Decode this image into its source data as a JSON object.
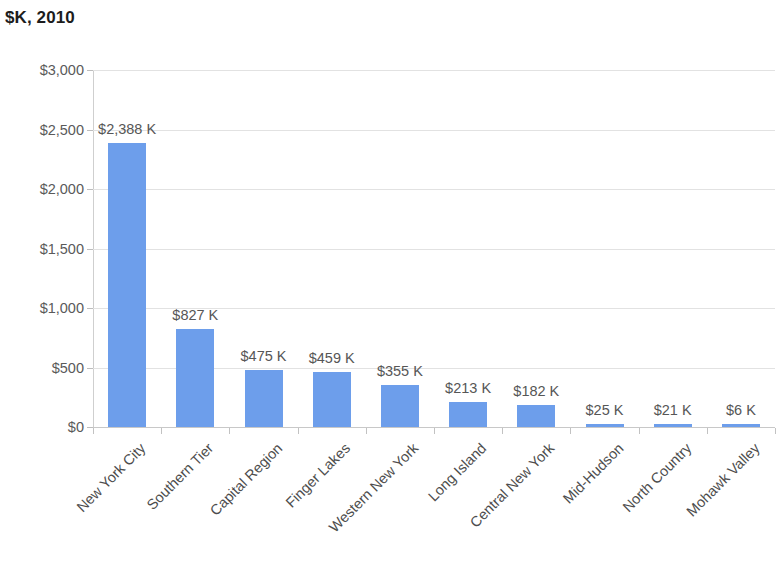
{
  "chart_data": {
    "type": "bar",
    "title": "$K, 2010",
    "xlabel": "",
    "ylabel": "",
    "ylim": [
      0,
      3000
    ],
    "ytick_labels": [
      "$3,000",
      "$2,500",
      "$2,000",
      "$1,500",
      "$1,000",
      "$500",
      "$0"
    ],
    "ytick_values": [
      3000,
      2500,
      2000,
      1500,
      1000,
      500,
      0
    ],
    "grid": true,
    "legend": false,
    "bar_color": "#6d9eeb",
    "categories": [
      "New York City",
      "Southern Tier",
      "Capital Region",
      "Finger Lakes",
      "Western New York",
      "Long Island",
      "Central New York",
      "Mid-Hudson",
      "North Country",
      "Mohawk Valley"
    ],
    "values": [
      2388,
      827,
      475,
      459,
      355,
      213,
      182,
      25,
      21,
      6
    ],
    "data_labels": [
      "$2,388 K",
      "$827 K",
      "$475 K",
      "$459 K",
      "$355 K",
      "$213 K",
      "$182 K",
      "$25 K",
      "$21 K",
      "$6 K"
    ]
  }
}
